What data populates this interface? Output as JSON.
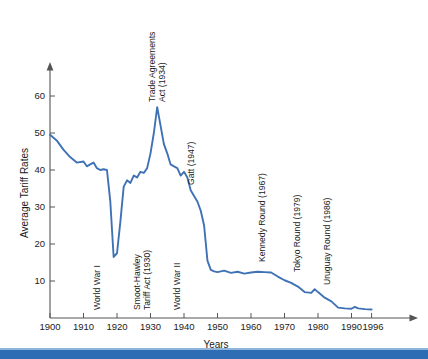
{
  "chart_data": {
    "type": "line",
    "title": "",
    "xlabel": "Years",
    "ylabel": "Average Tariff Rates",
    "xlim": [
      1900,
      1997
    ],
    "ylim": [
      0,
      66
    ],
    "grid": false,
    "legend": "none",
    "line_color": "#3f72b5",
    "x_ticks": [
      "1900",
      "1910",
      "1920",
      "1930",
      "1940",
      "1950",
      "1960",
      "1970",
      "1980",
      "1990",
      "1996"
    ],
    "x_tick_values": [
      1900,
      1910,
      1920,
      1930,
      1940,
      1950,
      1960,
      1970,
      1980,
      1990,
      1996
    ],
    "y_ticks": [
      "10",
      "20",
      "30",
      "40",
      "50",
      "60"
    ],
    "y_tick_values": [
      10,
      20,
      30,
      40,
      50,
      60
    ],
    "series": [
      {
        "name": "Average Tariff Rates",
        "x": [
          1900,
          1902,
          1904,
          1906,
          1908,
          1910,
          1911,
          1912,
          1913,
          1914,
          1915,
          1916,
          1917,
          1918,
          1919,
          1920,
          1921,
          1922,
          1923,
          1924,
          1925,
          1926,
          1927,
          1928,
          1929,
          1930,
          1931,
          1932,
          1933,
          1934,
          1935,
          1936,
          1937,
          1938,
          1939,
          1940,
          1941,
          1942,
          1943,
          1944,
          1945,
          1946,
          1947,
          1948,
          1949,
          1950,
          1952,
          1954,
          1956,
          1958,
          1960,
          1962,
          1964,
          1966,
          1968,
          1970,
          1972,
          1974,
          1976,
          1978,
          1979,
          1980,
          1982,
          1984,
          1986,
          1988,
          1990,
          1991,
          1992,
          1994,
          1996
        ],
        "y": [
          49.5,
          48.0,
          45.5,
          43.5,
          42.0,
          42.3,
          41.0,
          41.5,
          42.0,
          40.5,
          40.0,
          40.2,
          40.0,
          31.5,
          16.5,
          17.5,
          26.0,
          35.5,
          37.2,
          36.5,
          38.5,
          38.0,
          39.5,
          39.2,
          40.5,
          44.5,
          50.0,
          57.0,
          52.0,
          47.0,
          44.5,
          41.5,
          41.0,
          40.5,
          38.5,
          39.5,
          38.0,
          34.5,
          33.0,
          31.5,
          29.0,
          25.0,
          15.5,
          13.0,
          12.6,
          12.4,
          12.8,
          12.2,
          12.5,
          12.0,
          12.3,
          12.5,
          12.4,
          12.3,
          11.2,
          10.2,
          9.5,
          8.5,
          7.0,
          6.8,
          7.8,
          7.0,
          5.5,
          4.5,
          2.8,
          2.6,
          2.5,
          3.0,
          2.6,
          2.4,
          2.3
        ]
      }
    ],
    "annotations": [
      {
        "id": "world-war-1",
        "text": "World War I",
        "year": 1917
      },
      {
        "id": "smoot-hawley",
        "text": "Smoot-Hawley\nTariff Act (1930)",
        "line1": "Smoot-Hawley",
        "line2": "Tariff Act (1930)",
        "year": 1930
      },
      {
        "id": "trade-agreements-act",
        "text": "Trade Agreements\nAct (1934)",
        "line1": "Trade Agreements",
        "line2": "Act (1934)",
        "year": 1934
      },
      {
        "id": "world-war-2",
        "text": "World War II",
        "year": 1942
      },
      {
        "id": "gatt",
        "text": "Gatt (1947)",
        "year": 1947
      },
      {
        "id": "kennedy-round",
        "text": "Kennedy Round (1967)",
        "year": 1967
      },
      {
        "id": "tokyo-round",
        "text": "Tokyo Round (1979)",
        "year": 1979
      },
      {
        "id": "uruguay-round",
        "text": "Uruguay Round (1986)",
        "year": 1986
      }
    ]
  },
  "banner": {
    "color": "#2e6db4",
    "hairline_color": "#8fb4dc"
  }
}
